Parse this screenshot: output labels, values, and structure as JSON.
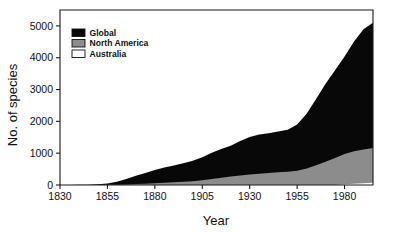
{
  "chart_data": {
    "type": "area",
    "stacked": true,
    "title": "",
    "xlabel": "Year",
    "ylabel": "No. of species",
    "xlim": [
      1830,
      1995
    ],
    "ylim": [
      0,
      5500
    ],
    "xticks": [
      1830,
      1855,
      1880,
      1905,
      1930,
      1955,
      1980
    ],
    "yticks": [
      0,
      1000,
      2000,
      3000,
      4000,
      5000
    ],
    "grid": false,
    "legend_position": "top-left inside",
    "legend": [
      "Global",
      "North America",
      "Australia"
    ],
    "colors": {
      "Global": "#080808",
      "North America": "#8c8c8c",
      "Australia": "#ffffff",
      "axis": "#1a1a1a",
      "background": "#ffffff"
    },
    "x": [
      1830,
      1835,
      1840,
      1845,
      1850,
      1855,
      1860,
      1865,
      1870,
      1875,
      1880,
      1885,
      1890,
      1895,
      1900,
      1905,
      1910,
      1915,
      1920,
      1925,
      1930,
      1935,
      1940,
      1945,
      1950,
      1955,
      1960,
      1965,
      1970,
      1975,
      1980,
      1985,
      1990,
      1995
    ],
    "series": [
      {
        "name": "Australia",
        "stack_order": 1,
        "values": [
          0,
          0,
          0,
          0,
          0,
          0,
          0,
          0,
          0,
          0,
          0,
          0,
          0,
          0,
          0,
          0,
          0,
          0,
          0,
          0,
          0,
          0,
          0,
          0,
          0,
          0,
          0,
          0,
          0,
          0,
          25,
          40,
          55,
          70
        ]
      },
      {
        "name": "North America",
        "stack_order": 2,
        "values": [
          0,
          0,
          0,
          0,
          0,
          5,
          10,
          18,
          28,
          40,
          55,
          70,
          85,
          100,
          120,
          150,
          185,
          230,
          270,
          300,
          330,
          355,
          380,
          400,
          420,
          450,
          520,
          620,
          730,
          850,
          950,
          1020,
          1060,
          1090
        ]
      },
      {
        "name": "Global",
        "stack_order": 3,
        "values": [
          0,
          0,
          5,
          10,
          20,
          45,
          90,
          170,
          260,
          340,
          420,
          480,
          530,
          580,
          640,
          720,
          830,
          900,
          960,
          1080,
          1180,
          1230,
          1250,
          1280,
          1320,
          1450,
          1720,
          2080,
          2450,
          2760,
          3060,
          3450,
          3780,
          3940
        ]
      }
    ],
    "cumulative_totals": [
      0,
      0,
      5,
      10,
      20,
      50,
      100,
      188,
      288,
      380,
      475,
      550,
      615,
      680,
      760,
      870,
      1015,
      1130,
      1230,
      1380,
      1510,
      1585,
      1630,
      1680,
      1740,
      1900,
      2240,
      2700,
      3180,
      3610,
      4035,
      4510,
      4895,
      5100
    ]
  },
  "axes": {
    "ylabel": "No. of species",
    "xlabel": "Year",
    "xtick_labels": [
      "1830",
      "1855",
      "1880",
      "1905",
      "1930",
      "1955",
      "1980"
    ],
    "ytick_labels": [
      "0",
      "1000",
      "2000",
      "3000",
      "4000",
      "5000"
    ]
  },
  "legend": {
    "items": [
      {
        "label": "Global",
        "swatch": "#080808"
      },
      {
        "label": "North America",
        "swatch": "#8c8c8c"
      },
      {
        "label": "Australia",
        "swatch": "#ffffff"
      }
    ]
  }
}
